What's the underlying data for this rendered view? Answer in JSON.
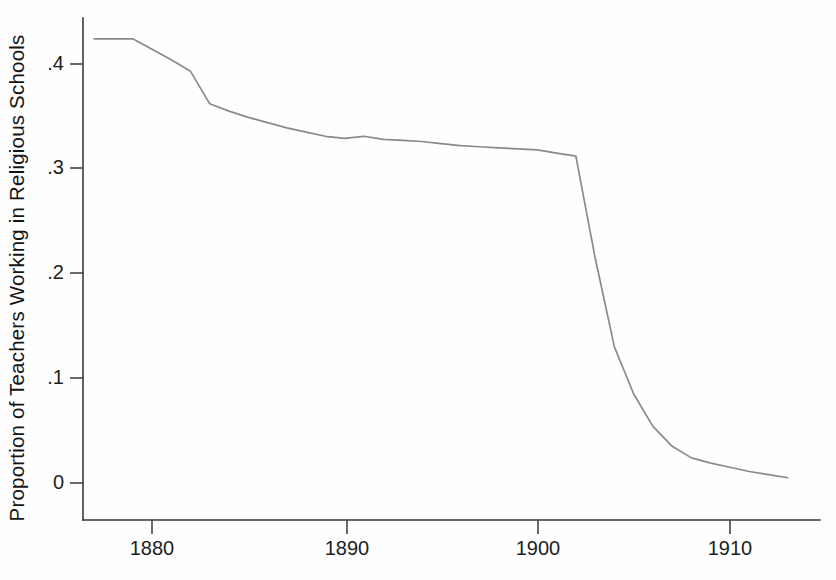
{
  "chart_data": {
    "type": "line",
    "title": "",
    "subtitle": "",
    "xlabel": "",
    "ylabel": "Proportion of Teachers Working in Religious Schools",
    "xlim": [
      1876.5,
      1913.5
    ],
    "ylim": [
      0,
      0.46
    ],
    "grid": false,
    "legend": null,
    "annotations": [],
    "x_tick_labels": [
      "1880",
      "1890",
      "1900",
      "1910"
    ],
    "x_ticks": [
      1880,
      1890,
      1900,
      1910
    ],
    "y_tick_labels": [
      "0",
      ".1",
      ".2",
      ".3",
      ".4"
    ],
    "y_ticks": [
      0,
      0.1,
      0.2,
      0.3,
      0.4
    ],
    "series": [
      {
        "name": "Proportion of teachers in religious schools",
        "color": "#8a8a8a",
        "x": [
          1877,
          1878,
          1879,
          1880,
          1881,
          1882,
          1883,
          1884,
          1885,
          1886,
          1887,
          1888,
          1889,
          1890,
          1891,
          1892,
          1893,
          1894,
          1895,
          1896,
          1897,
          1898,
          1899,
          1900,
          1901,
          1902,
          1903,
          1904,
          1905,
          1906,
          1907,
          1908,
          1909,
          1910,
          1911,
          1912,
          1913
        ],
        "values": [
          0.424,
          0.424,
          0.424,
          0.414,
          0.404,
          0.393,
          0.362,
          0.355,
          0.349,
          0.344,
          0.339,
          0.335,
          0.331,
          0.329,
          0.331,
          0.328,
          0.327,
          0.326,
          0.324,
          0.322,
          0.321,
          0.32,
          0.319,
          0.318,
          0.315,
          0.312,
          0.215,
          0.13,
          0.085,
          0.054,
          0.035,
          0.024,
          0.019,
          0.015,
          0.011,
          0.008,
          0.005
        ]
      }
    ]
  }
}
